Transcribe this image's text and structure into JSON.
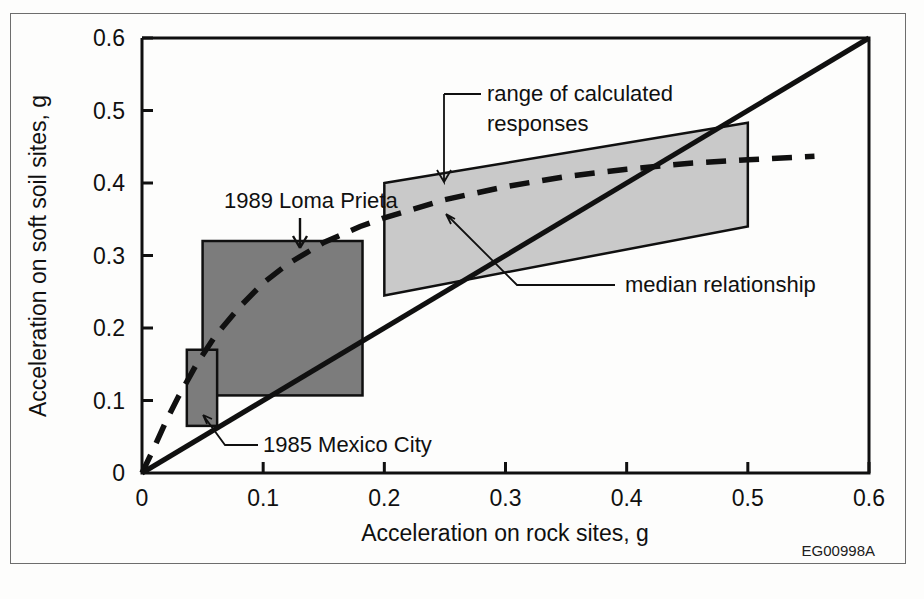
{
  "figure": {
    "id_tag": "EG00998A",
    "background_color": "#fdfdfc",
    "frame_color": "#6d6d6d"
  },
  "chart_data": {
    "type": "line",
    "title": "",
    "xlabel": "Acceleration on rock sites, g",
    "ylabel": "Acceleration on soft soil sites, g",
    "xlim": [
      0,
      0.6
    ],
    "ylim": [
      0,
      0.6
    ],
    "xticks": [
      0,
      0.1,
      0.2,
      0.3,
      0.4,
      0.5,
      0.6
    ],
    "xtick_labels": [
      "0",
      "0.1",
      "0.2",
      "0.3",
      "0.4",
      "0.5",
      "0.6"
    ],
    "yticks": [
      0,
      0.1,
      0.2,
      0.3,
      0.4,
      0.5,
      0.6
    ],
    "ytick_labels": [
      "0",
      "0.1",
      "0.2",
      "0.3",
      "0.4",
      "0.5",
      "0.6"
    ],
    "grid": false,
    "legend_position": "none",
    "series": [
      {
        "name": "median relationship",
        "style": "dashed",
        "color": "#101010",
        "points": [
          [
            0.0,
            0.0
          ],
          [
            0.01,
            0.035
          ],
          [
            0.02,
            0.072
          ],
          [
            0.03,
            0.105
          ],
          [
            0.045,
            0.15
          ],
          [
            0.06,
            0.188
          ],
          [
            0.08,
            0.228
          ],
          [
            0.1,
            0.262
          ],
          [
            0.12,
            0.288
          ],
          [
            0.15,
            0.318
          ],
          [
            0.18,
            0.34
          ],
          [
            0.2,
            0.352
          ],
          [
            0.25,
            0.377
          ],
          [
            0.3,
            0.395
          ],
          [
            0.35,
            0.409
          ],
          [
            0.4,
            0.419
          ],
          [
            0.45,
            0.427
          ],
          [
            0.5,
            0.432
          ],
          [
            0.555,
            0.437
          ]
        ]
      },
      {
        "name": "one-to-one line",
        "style": "solid",
        "color": "#101010",
        "points": [
          [
            0.0,
            0.0
          ],
          [
            0.6,
            0.6
          ]
        ]
      }
    ],
    "regions": [
      {
        "name": "range of calculated responses",
        "shape": "polygon",
        "fill": "#c9c9c9",
        "stroke": "#101010",
        "vertices": [
          [
            0.2,
            0.4
          ],
          [
            0.5,
            0.483
          ],
          [
            0.5,
            0.34
          ],
          [
            0.2,
            0.245
          ]
        ]
      },
      {
        "name": "1989 Loma Prieta",
        "shape": "rect",
        "fill": "#7c7c7c",
        "stroke": "#101010",
        "x_range": [
          0.05,
          0.182
        ],
        "y_range": [
          0.107,
          0.32
        ]
      },
      {
        "name": "1985 Mexico City",
        "shape": "rect",
        "fill": "#7c7c7c",
        "stroke": "#101010",
        "x_range": [
          0.037,
          0.062
        ],
        "y_range": [
          0.065,
          0.17
        ]
      }
    ],
    "annotations": [
      {
        "name": "range-of-calculated-responses",
        "text_line1": "range of calculated",
        "text_line2": "responses",
        "text_x": 487,
        "text_y": 101,
        "text_y2": 131,
        "leader": "M 444 94 L 444 182 L 437 170 M 444 182 L 451 170",
        "elbow": "M 444 94 L 481 94"
      },
      {
        "name": "median-relationship",
        "text_line1": "median relationship",
        "text_line2": "",
        "text_x": 625,
        "text_y": 292,
        "leader": "M 615 285 L 517 285 L 446 214 M 446 214 L 455 219 M 446 214 L 451 224",
        "elbow": ""
      },
      {
        "name": "1989-loma-prieta",
        "text_line1": "1989 Loma Prieta",
        "text_line2": "",
        "text_x": 224,
        "text_y": 208,
        "leader": "M 300 218 L 300 248 M 300 248 L 293 236 M 300 248 L 307 236",
        "elbow": ""
      },
      {
        "name": "1985-mexico-city",
        "text_line1": "1985 Mexico City",
        "text_line2": "",
        "text_x": 263,
        "text_y": 452,
        "leader": "M 258 445 L 225 445 L 203 415 M 203 415 L 212 419 M 203 415 L 207 424",
        "elbow": ""
      }
    ]
  }
}
